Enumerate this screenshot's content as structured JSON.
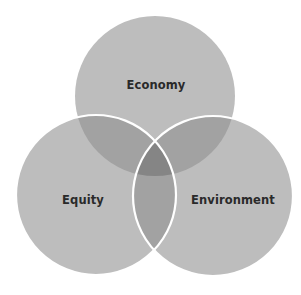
{
  "diagram": {
    "type": "venn",
    "sets": [
      {
        "id": "economy",
        "label": "Economy",
        "cx": 155,
        "cy": 96,
        "r": 80
      },
      {
        "id": "equity",
        "label": "Equity",
        "cx": 96,
        "cy": 195,
        "r": 80
      },
      {
        "id": "environment",
        "label": "Environment",
        "cx": 213,
        "cy": 196,
        "r": 80
      }
    ],
    "colors": {
      "single": "#bdbdbd",
      "double": "#a2a2a2",
      "triple": "#858585",
      "outline": "#ffffff",
      "text": "#2a2a2a"
    }
  }
}
